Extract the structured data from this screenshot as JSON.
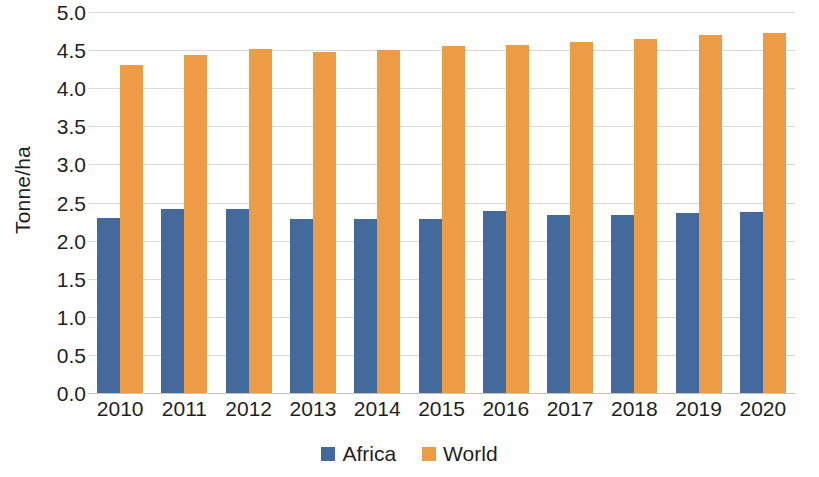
{
  "chart_data": {
    "type": "bar",
    "title": "",
    "subtitle": "",
    "xlabel": "",
    "ylabel": "Tonne/ha",
    "ylim": [
      0.0,
      5.0
    ],
    "ytick_labels": [
      "5.0",
      "4.5",
      "4.0",
      "3.5",
      "3.0",
      "2.5",
      "2.0",
      "1.5",
      "1.0",
      "0.5",
      "0.0"
    ],
    "ytick_values": [
      5.0,
      4.5,
      4.0,
      3.5,
      3.0,
      2.5,
      2.0,
      1.5,
      1.0,
      0.5,
      0.0
    ],
    "grid": true,
    "grid_axis": "y",
    "legend_position": "bottom",
    "categories": [
      "2010",
      "2011",
      "2012",
      "2013",
      "2014",
      "2015",
      "2016",
      "2017",
      "2018",
      "2019",
      "2020"
    ],
    "series": [
      {
        "name": "Africa",
        "color": "#44699d",
        "values": [
          2.3,
          2.42,
          2.41,
          2.28,
          2.28,
          2.28,
          2.39,
          2.33,
          2.33,
          2.36,
          2.37
        ]
      },
      {
        "name": "World",
        "color": "#ed9c45",
        "values": [
          4.3,
          4.44,
          4.52,
          4.48,
          4.5,
          4.56,
          4.57,
          4.6,
          4.65,
          4.7,
          4.73
        ]
      }
    ]
  }
}
